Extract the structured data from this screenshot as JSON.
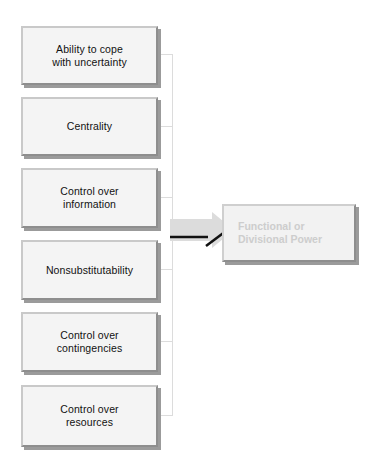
{
  "diagram": {
    "canvas": {
      "width": 371,
      "height": 467,
      "background": "#ffffff"
    },
    "colors": {
      "box_fill": "#f4f4f4",
      "box_border_light": "#c9c9c9",
      "box_border_dark": "#8e8e8e",
      "box_shadow": "#9b9b9b",
      "connector_line": "#dcdcdc",
      "arrow_fill": "#dcdcdc",
      "arrow_stroke": "#111111",
      "source_text": "#111111",
      "target_text": "#cdcdcd"
    },
    "sources": [
      {
        "id": "ability-to-cope-with-uncertainty",
        "label": "Ability to cope\nwith uncertainty",
        "x": 21,
        "y": 26,
        "width": 137,
        "height": 59
      },
      {
        "id": "centrality",
        "label": "Centrality",
        "x": 21,
        "y": 97,
        "width": 137,
        "height": 59
      },
      {
        "id": "control-over-information",
        "label": "Control over\ninformation",
        "x": 21,
        "y": 168,
        "width": 137,
        "height": 60
      },
      {
        "id": "nonsubstitutability",
        "label": "Nonsubstitutability",
        "x": 21,
        "y": 240,
        "width": 137,
        "height": 60
      },
      {
        "id": "control-over-contingencies",
        "label": "Control over\ncontingencies",
        "x": 21,
        "y": 312,
        "width": 137,
        "height": 60
      },
      {
        "id": "control-over-resources",
        "label": "Control over\nresources",
        "x": 21,
        "y": 385,
        "width": 137,
        "height": 62
      }
    ],
    "target": {
      "id": "functional-or-divisional-power",
      "label": "Functional or\nDivisional Power",
      "x": 222,
      "y": 204,
      "width": 134,
      "height": 58
    },
    "connectors": {
      "trunk_x": 172,
      "trunk_top": 54,
      "trunk_bottom": 415,
      "stub_start_x": 158,
      "stub_y_values": [
        54,
        126,
        197,
        269,
        341,
        415
      ]
    },
    "arrow": {
      "direction": "right",
      "from": "connector-trunk",
      "to": "functional-or-divisional-power",
      "x": 170,
      "y": 212,
      "width": 64,
      "height": 36
    }
  }
}
